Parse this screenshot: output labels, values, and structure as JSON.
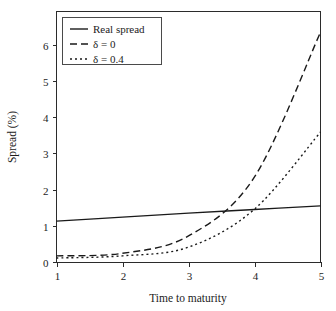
{
  "figure": {
    "background": "#ffffff",
    "axis_color": "#2b2b2b",
    "line_color": "#1a1a1a"
  },
  "chart_data": {
    "type": "line",
    "title": "",
    "xlabel": "Time to maturity",
    "ylabel": "Spread (%)",
    "x": [
      1,
      2,
      3,
      4,
      5
    ],
    "xlim": [
      1,
      5
    ],
    "ylim": [
      0,
      6.5
    ],
    "xticks": [
      1,
      2,
      3,
      4,
      5
    ],
    "xtick_labels": [
      "1",
      "2",
      "3",
      "4",
      "5"
    ],
    "yticks": [
      0,
      1,
      2,
      3,
      4,
      5,
      6
    ],
    "ytick_labels": [
      "0",
      "1",
      "2",
      "3",
      "4",
      "5",
      "6"
    ],
    "grid": false,
    "legend_position": "upper left",
    "series": [
      {
        "name": "Real spread",
        "style": "solid",
        "dash": "none",
        "values": [
          1.13,
          1.24,
          1.35,
          1.45,
          1.55
        ]
      },
      {
        "name": "δ = 0",
        "style": "dashed",
        "dash": "7,4",
        "values": [
          0.17,
          0.24,
          0.72,
          2.35,
          6.35
        ]
      },
      {
        "name": "δ = 0.4",
        "style": "dotted",
        "dash": "2,3",
        "values": [
          0.11,
          0.17,
          0.41,
          1.46,
          3.59
        ]
      }
    ]
  },
  "legend": {
    "entries": [
      {
        "label": "Real spread"
      },
      {
        "label": "δ = 0"
      },
      {
        "label": "δ = 0.4"
      }
    ]
  }
}
